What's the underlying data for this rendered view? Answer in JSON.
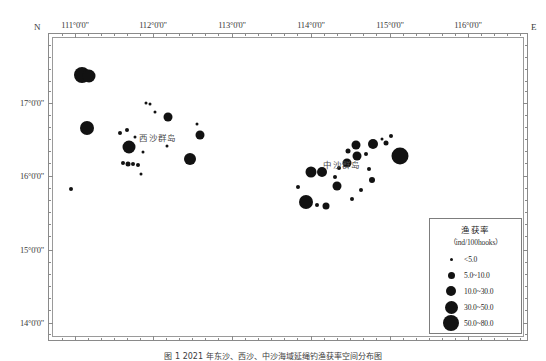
{
  "figure": {
    "caption": "图 1   2021 年东沙、西沙、中沙海域延绳钓渔获率空间分布图",
    "corner_n": "N",
    "corner_e": "E"
  },
  "axes": {
    "x_labels": [
      "111°0'0\"",
      "112°0'0\"",
      "113°0'0\"",
      "114°0'0\"",
      "115°0'0\"",
      "116°0'0\""
    ],
    "x_positions": [
      75,
      153,
      232,
      311,
      390,
      468
    ],
    "y_labels": [
      "17°0'0\"",
      "16°0'0\"",
      "15°0'0\"",
      "14°0'0\""
    ],
    "y_positions": [
      103,
      176,
      250,
      323
    ],
    "x_minor_positions": [
      62,
      88,
      101,
      114,
      127,
      140,
      166,
      179,
      192,
      205,
      218,
      245,
      258,
      271,
      284,
      297,
      324,
      337,
      350,
      363,
      376,
      403,
      416,
      429,
      442,
      455,
      481,
      494,
      507,
      520
    ],
    "y_minor_positions": [
      45,
      57,
      69,
      81,
      91,
      115,
      127,
      139,
      151,
      163,
      188,
      200,
      212,
      224,
      236,
      262,
      274,
      286,
      298,
      310,
      334
    ]
  },
  "place_labels": [
    {
      "name": "xisha-islands",
      "text": "西沙群岛",
      "x": 158,
      "y": 137
    },
    {
      "name": "zhongsha-islands",
      "text": "中沙群岛",
      "x": 342,
      "y": 164
    }
  ],
  "legend": {
    "title": "渔获率",
    "subtitle": "（ind/100hooks）",
    "entries": [
      {
        "label": "<5.0",
        "size": 3
      },
      {
        "label": "5.0~10.0",
        "size": 7
      },
      {
        "label": "10.0~30.0",
        "size": 10
      },
      {
        "label": "30.0~50.0",
        "size": 13
      },
      {
        "label": "50.0~80.0",
        "size": 16
      }
    ]
  },
  "chart_data": {
    "type": "scatter",
    "title": "渔获率空间分布",
    "xlabel": "Longitude (E)",
    "ylabel": "Latitude (N)",
    "xlim": [
      110.6,
      116.4
    ],
    "ylim": [
      13.85,
      17.55
    ],
    "grid": false,
    "legend_position": "bottom-right",
    "value_unit": "ind/100hooks",
    "size_bins": [
      {
        "label": "<5.0",
        "px": 3
      },
      {
        "label": "5.0~10.0",
        "px": 7
      },
      {
        "label": "10.0~30.0",
        "px": 10
      },
      {
        "label": "30.0~50.0",
        "px": 13
      },
      {
        "label": "50.0~80.0",
        "px": 16
      }
    ],
    "points": [
      {
        "x": 110.97,
        "y": 17.08,
        "size": 16
      },
      {
        "x": 111.06,
        "y": 17.07,
        "size": 13
      },
      {
        "x": 111.03,
        "y": 16.43,
        "size": 14
      },
      {
        "x": 111.43,
        "y": 16.37,
        "size": 4
      },
      {
        "x": 111.52,
        "y": 16.4,
        "size": 4
      },
      {
        "x": 111.62,
        "y": 16.32,
        "size": 3
      },
      {
        "x": 111.55,
        "y": 16.19,
        "size": 13
      },
      {
        "x": 111.76,
        "y": 16.74,
        "size": 3
      },
      {
        "x": 111.8,
        "y": 16.72,
        "size": 3
      },
      {
        "x": 111.86,
        "y": 16.63,
        "size": 3
      },
      {
        "x": 112.03,
        "y": 16.56,
        "size": 9
      },
      {
        "x": 112.38,
        "y": 16.48,
        "size": 3
      },
      {
        "x": 112.42,
        "y": 16.34,
        "size": 9
      },
      {
        "x": 111.47,
        "y": 16.0,
        "size": 4
      },
      {
        "x": 111.53,
        "y": 15.98,
        "size": 5
      },
      {
        "x": 111.6,
        "y": 15.99,
        "size": 4
      },
      {
        "x": 111.66,
        "y": 15.97,
        "size": 4
      },
      {
        "x": 111.72,
        "y": 16.13,
        "size": 3
      },
      {
        "x": 111.69,
        "y": 15.86,
        "size": 3
      },
      {
        "x": 112.01,
        "y": 16.21,
        "size": 3
      },
      {
        "x": 112.3,
        "y": 16.04,
        "size": 12
      },
      {
        "x": 110.83,
        "y": 15.68,
        "size": 4
      },
      {
        "x": 113.62,
        "y": 15.7,
        "size": 4
      },
      {
        "x": 113.72,
        "y": 15.52,
        "size": 14
      },
      {
        "x": 113.86,
        "y": 15.48,
        "size": 4
      },
      {
        "x": 113.97,
        "y": 15.47,
        "size": 7
      },
      {
        "x": 113.78,
        "y": 15.88,
        "size": 11
      },
      {
        "x": 113.92,
        "y": 15.88,
        "size": 10
      },
      {
        "x": 114.08,
        "y": 15.82,
        "size": 4
      },
      {
        "x": 114.13,
        "y": 15.93,
        "size": 4
      },
      {
        "x": 114.1,
        "y": 15.71,
        "size": 9
      },
      {
        "x": 114.22,
        "y": 16.0,
        "size": 9
      },
      {
        "x": 114.24,
        "y": 16.15,
        "size": 5
      },
      {
        "x": 114.34,
        "y": 16.22,
        "size": 9
      },
      {
        "x": 114.35,
        "y": 16.08,
        "size": 9
      },
      {
        "x": 114.46,
        "y": 16.11,
        "size": 4
      },
      {
        "x": 114.49,
        "y": 15.92,
        "size": 4
      },
      {
        "x": 114.55,
        "y": 16.23,
        "size": 10
      },
      {
        "x": 114.53,
        "y": 15.79,
        "size": 6
      },
      {
        "x": 114.66,
        "y": 16.29,
        "size": 3
      },
      {
        "x": 114.7,
        "y": 16.24,
        "size": 5
      },
      {
        "x": 114.77,
        "y": 16.33,
        "size": 4
      },
      {
        "x": 114.88,
        "y": 16.08,
        "size": 17
      },
      {
        "x": 114.29,
        "y": 15.55,
        "size": 4
      },
      {
        "x": 114.4,
        "y": 15.66,
        "size": 4
      }
    ]
  }
}
